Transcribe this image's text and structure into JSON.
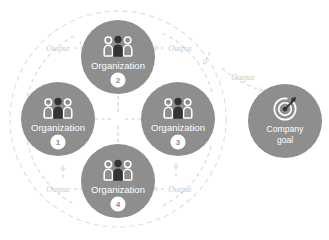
{
  "diagram": {
    "colors": {
      "node_fill": "#8e8e8e",
      "node_fill_dark": "#7f7f7f",
      "node_text": "#ffffff",
      "badge_fill": "#ffffff",
      "badge_text": "#8e8e8e",
      "flow_line": "#d2d2d2",
      "flow_text": "#c9c9c9",
      "background": "#ffffff",
      "icon_dark": "#3a3a3a",
      "icon_light": "#ffffff"
    },
    "nodes": [
      {
        "id": "org2",
        "label": "Organization",
        "badge": "2",
        "icon": "people-group-icon",
        "cx": 118,
        "cy": 57,
        "r": 37
      },
      {
        "id": "org1",
        "label": "Organization",
        "badge": "1",
        "icon": "people-group-icon",
        "cx": 58,
        "cy": 119,
        "r": 37
      },
      {
        "id": "org3",
        "label": "Organization",
        "badge": "3",
        "icon": "people-group-icon",
        "cx": 178,
        "cy": 119,
        "r": 37
      },
      {
        "id": "org4",
        "label": "Organization",
        "badge": "4",
        "icon": "people-group-icon",
        "cx": 118,
        "cy": 181,
        "r": 37
      },
      {
        "id": "goal",
        "label_line1": "Company",
        "label_line2": "goal",
        "icon": "target-goal-icon",
        "cx": 285,
        "cy": 121,
        "r": 37
      }
    ],
    "flows": [
      {
        "id": "flow-top-left",
        "label": "Output",
        "lx": 58,
        "ly": 49
      },
      {
        "id": "flow-top-right",
        "label": "Output",
        "lx": 180,
        "ly": 49
      },
      {
        "id": "flow-bottom-left",
        "label": "Output",
        "lx": 58,
        "ly": 190
      },
      {
        "id": "flow-bottom-right",
        "label": "Output",
        "lx": 180,
        "ly": 190
      },
      {
        "id": "flow-to-goal",
        "label": "Output",
        "lx": 243,
        "ly": 78
      }
    ],
    "center_cross": {
      "id": "center-exchange-arrows",
      "directions": [
        "up",
        "down",
        "left",
        "right"
      ]
    },
    "outer_boundary": {
      "id": "organization-cluster-boundary",
      "style": "dashed-circle",
      "cx": 118,
      "cy": 119,
      "r": 108
    }
  }
}
